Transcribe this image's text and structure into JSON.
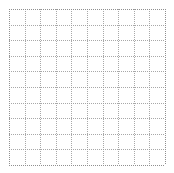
{
  "figure": {
    "kind": "blank-dotted-grid",
    "background_color": "#ffffff",
    "grid_color": "#9a9a9a",
    "border_color": "#8a8a8a",
    "title": "",
    "has_text": false
  },
  "chart_data": {
    "type": "line",
    "title": "",
    "subtitle": "",
    "xlabel": "",
    "ylabel": "",
    "grid": true,
    "grid_style": "dotted",
    "legend": null,
    "legend_position": "none",
    "annotations": [],
    "xlim": [
      0,
      10
    ],
    "ylim": [
      0,
      10
    ],
    "xticks": [
      0,
      1,
      2,
      3,
      4,
      5,
      6,
      7,
      8,
      9,
      10
    ],
    "yticks": [
      0,
      1,
      2,
      3,
      4,
      5,
      6,
      7,
      8,
      9,
      10
    ],
    "xticklabels": [
      "",
      "",
      "",
      "",
      "",
      "",
      "",
      "",
      "",
      "",
      ""
    ],
    "yticklabels": [
      "",
      "",
      "",
      "",
      "",
      "",
      "",
      "",
      "",
      "",
      ""
    ],
    "series": [],
    "x": [],
    "values": [],
    "categories": []
  },
  "plot_area": {
    "left_px": 9,
    "top_px": 9,
    "width_px": 156,
    "height_px": 156,
    "columns": 10,
    "rows": 10,
    "cell_width_px": 15.6,
    "cell_height_px": 15.6
  }
}
